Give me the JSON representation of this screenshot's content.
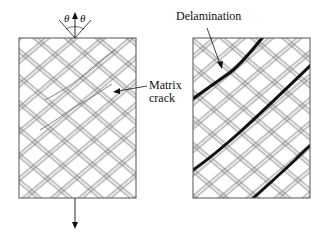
{
  "figure": {
    "left_panel": {
      "name": "matrix-crack-laminate",
      "theta_left": "θ",
      "theta_right": "θ",
      "label_line1": "Matrix",
      "label_line2": "crack"
    },
    "right_panel": {
      "name": "delamination-laminate",
      "label": "Delamination"
    },
    "colors": {
      "fiber_lines": "#7a7a7a",
      "border": "#555555",
      "delamination": "#111111",
      "text": "#111111",
      "background": "#ffffff"
    }
  }
}
